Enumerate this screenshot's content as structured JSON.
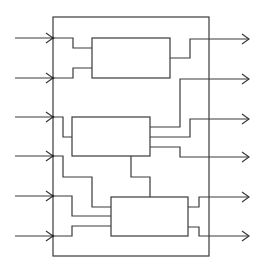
{
  "diagram": {
    "colors": {
      "stroke": "#3a3a3a",
      "background": "#ffffff"
    },
    "outer_box": {
      "x": 53,
      "y": 17,
      "w": 156,
      "h": 239
    },
    "blocks": [
      {
        "id": "block-1",
        "x": 92,
        "y": 38,
        "w": 78,
        "h": 40
      },
      {
        "id": "block-2",
        "x": 72,
        "y": 117,
        "w": 78,
        "h": 39
      },
      {
        "id": "block-3",
        "x": 111,
        "y": 197,
        "w": 77,
        "h": 39
      }
    ],
    "inputs": [
      {
        "id": "input-1",
        "y": 38
      },
      {
        "id": "input-2",
        "y": 78
      },
      {
        "id": "input-3",
        "y": 117
      },
      {
        "id": "input-4",
        "y": 156
      },
      {
        "id": "input-5",
        "y": 196
      },
      {
        "id": "input-6",
        "y": 236
      }
    ],
    "outputs": [
      {
        "id": "output-1",
        "y": 39
      },
      {
        "id": "output-2",
        "y": 79
      },
      {
        "id": "output-3",
        "y": 119
      },
      {
        "id": "output-4",
        "y": 157
      },
      {
        "id": "output-5",
        "y": 197
      },
      {
        "id": "output-6",
        "y": 236
      }
    ]
  }
}
